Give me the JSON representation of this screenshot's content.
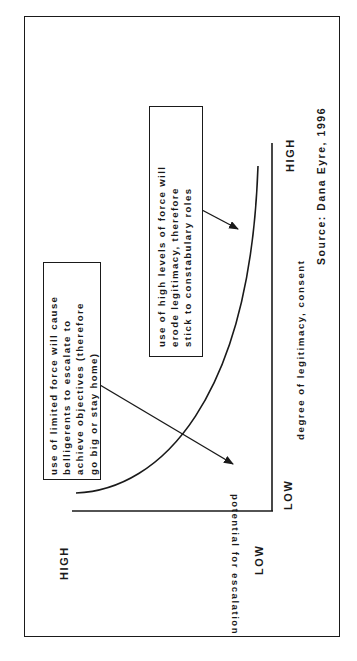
{
  "diagram": {
    "title": "",
    "orientation": "rotated 90deg counter-clockwise",
    "y_axis": {
      "label": "potential for escalation",
      "high_label": "HIGH",
      "low_label": "LOW"
    },
    "x_axis": {
      "label": "degree of legitimacy, consent",
      "low_label": "LOW",
      "high_label": "HIGH"
    },
    "curve": "rising convex curve: escalation potential increases sharply as legitimacy rises",
    "annotations": [
      {
        "id": "limited-force",
        "lines": [
          "use of limited force will cause",
          "belligerents to escalate to",
          "achieve objectives (therefore",
          "go big or stay home)"
        ],
        "points_to": "low legitimacy region"
      },
      {
        "id": "high-force",
        "lines": [
          "use of high levels of force will",
          "erode legitimacy, therefore",
          "stick to constabulary roles"
        ],
        "points_to": "high legitimacy region"
      }
    ],
    "source": "Source: Dana Eyre, 1996",
    "colors": {
      "ink": "#1a1a1a",
      "background": "#ffffff"
    }
  }
}
